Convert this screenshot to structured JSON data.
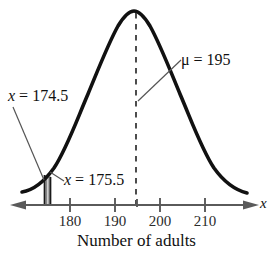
{
  "figure": {
    "caption": "Number of adults",
    "axis_label": "x",
    "axis_variable_name": "x-axis-variable"
  },
  "annotations": {
    "mu_label": "μ = 195",
    "lower_bound_label": "x = 174.5",
    "upper_bound_label": "x = 175.5"
  },
  "colors": {
    "curve": "#111111",
    "axis": "#4a4a4a",
    "dashed": "#3a3a3a",
    "shaded_region": "#8c8c8c",
    "text": "#111111"
  },
  "chart_data": {
    "type": "line",
    "title": "",
    "subtitle": "",
    "xlabel": "Number of adults",
    "ylabel": "",
    "axis_variable": "x",
    "grid": false,
    "legend": "none",
    "distribution": "normal",
    "mean": 195,
    "mean_label": "μ = 195",
    "xlim": [
      168,
      217
    ],
    "tick_values": [
      180,
      190,
      200,
      210
    ],
    "tick_labels": [
      "180",
      "190",
      "200",
      "210"
    ],
    "minor_tick_values": [
      195
    ],
    "minor_tick_labels": [
      ""
    ],
    "dashed_reference_line": {
      "x": 195,
      "style": "dashed",
      "from": "peak",
      "to": "axis"
    },
    "shaded_region": {
      "x_start": 174.5,
      "x_end": 175.5,
      "label_start": "x = 174.5",
      "label_end": "x = 175.5",
      "pattern": "vertical-hatch",
      "description": "narrow shaded strip under the normal curve between 174.5 and 175.5"
    },
    "annotations": [
      {
        "text": "μ = 195",
        "points_to_x": 195,
        "position": "upper-right"
      },
      {
        "text": "x = 174.5",
        "points_to_x": 174.5,
        "position": "upper-left"
      },
      {
        "text": "x = 175.5",
        "points_to_x": 175.5,
        "position": "lower-left"
      }
    ],
    "curve_points": [
      {
        "x": 168.0,
        "y": 0.02
      },
      {
        "x": 170.0,
        "y": 0.05
      },
      {
        "x": 172.5,
        "y": 0.09
      },
      {
        "x": 175.0,
        "y": 0.15
      },
      {
        "x": 177.5,
        "y": 0.22
      },
      {
        "x": 180.0,
        "y": 0.31
      },
      {
        "x": 182.5,
        "y": 0.43
      },
      {
        "x": 185.0,
        "y": 0.56
      },
      {
        "x": 187.5,
        "y": 0.7
      },
      {
        "x": 190.0,
        "y": 0.83
      },
      {
        "x": 192.5,
        "y": 0.95
      },
      {
        "x": 195.0,
        "y": 1.0
      },
      {
        "x": 197.5,
        "y": 0.95
      },
      {
        "x": 200.0,
        "y": 0.83
      },
      {
        "x": 202.5,
        "y": 0.7
      },
      {
        "x": 205.0,
        "y": 0.56
      },
      {
        "x": 207.5,
        "y": 0.43
      },
      {
        "x": 210.0,
        "y": 0.31
      },
      {
        "x": 212.5,
        "y": 0.22
      },
      {
        "x": 215.0,
        "y": 0.15
      },
      {
        "x": 217.0,
        "y": 0.1
      }
    ]
  }
}
